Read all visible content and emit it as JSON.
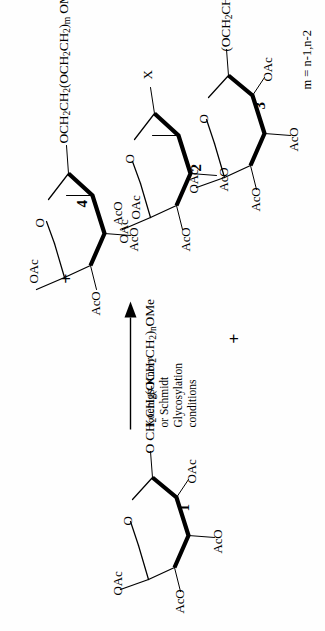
{
  "scheme": {
    "type": "chemical-reaction-scheme",
    "orientation": "rotated-90-ccw",
    "reaction_arrow": {
      "direction": "right",
      "conditions_lines": [
        "Koenigs-Knorr",
        "or Schmidt",
        "Glycosylation",
        "conditions"
      ]
    },
    "plus_symbol": "+",
    "footnote": "m = n-1,n-2",
    "compounds": [
      {
        "id": "compound-1",
        "number": "1",
        "role": "glycosyl-acceptor",
        "substituents": [
          "OAc",
          "AcO",
          "AcO",
          "OAc"
        ],
        "ring_oxygen": "O",
        "chain_prefix": "O",
        "chain": "CH2CH2(OCH2CH2)nOMe",
        "chain_parts": [
          {
            "t": "O CH",
            "sub": false
          },
          {
            "t": "2",
            "sub": true
          },
          {
            "t": "CH",
            "sub": false
          },
          {
            "t": "2",
            "sub": true
          },
          {
            "t": "(OCH",
            "sub": false
          },
          {
            "t": "2",
            "sub": true
          },
          {
            "t": "CH",
            "sub": false
          },
          {
            "t": "2",
            "sub": true
          },
          {
            "t": ")",
            "sub": false
          },
          {
            "t": "n",
            "sub": true
          },
          {
            "t": "OMe",
            "sub": false
          }
        ]
      },
      {
        "id": "compound-2",
        "number": "2",
        "role": "glycosyl-donor",
        "substituents": [
          "OAc",
          "OAc",
          "AcO",
          "AcO"
        ],
        "ring_oxygen": "O",
        "leaving_group": "X"
      },
      {
        "id": "compound-3",
        "number": "3",
        "role": "byproduct-acceptor",
        "substituents": [
          "OAc",
          "AcO",
          "AcO",
          "OAc"
        ],
        "ring_oxygen": "O",
        "chain": "(OCH2CH2)1,2OH",
        "chain_parts": [
          {
            "t": "(OCH",
            "sub": false
          },
          {
            "t": "2",
            "sub": true
          },
          {
            "t": "CH",
            "sub": false
          },
          {
            "t": "2",
            "sub": true
          },
          {
            "t": ")",
            "sub": false
          },
          {
            "t": "1,2",
            "sub": true
          },
          {
            "t": "OH",
            "sub": false
          }
        ]
      },
      {
        "id": "compound-4",
        "number": "4",
        "role": "glycosylation-product",
        "substituents": [
          "OAc",
          "AcO",
          "AcO",
          "AcO"
        ],
        "ring_oxygen": "O",
        "chain": "OCH2CH2(OCH2CH2)m OMe",
        "chain_parts": [
          {
            "t": "OCH",
            "sub": false
          },
          {
            "t": "2",
            "sub": true
          },
          {
            "t": "CH",
            "sub": false
          },
          {
            "t": "2",
            "sub": true
          },
          {
            "t": "(OCH",
            "sub": false
          },
          {
            "t": "2",
            "sub": true
          },
          {
            "t": "CH",
            "sub": false
          },
          {
            "t": "2",
            "sub": true
          },
          {
            "t": ")",
            "sub": false
          },
          {
            "t": "m",
            "sub": true
          },
          {
            "t": " OMe",
            "sub": false
          }
        ]
      }
    ],
    "atom_labels": {
      "oac": "OAc",
      "aco": "AcO",
      "o": "O",
      "x": "X"
    },
    "colors": {
      "ink": "#000000",
      "background": "#ffffff"
    }
  }
}
